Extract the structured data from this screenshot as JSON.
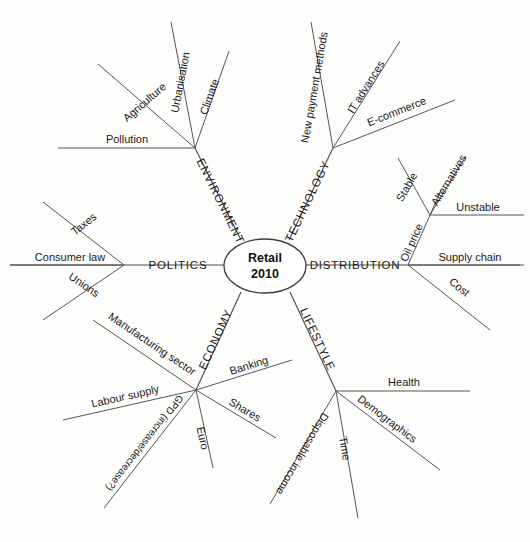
{
  "diagram": {
    "type": "radial-mind-map",
    "center": {
      "line1": "Retail",
      "line2": "2010"
    },
    "branches": [
      {
        "id": "environment",
        "label": "ENVIRONMENT",
        "twigs": [
          "Pollution",
          "Agriculture",
          "Urbanisation",
          "Climate"
        ]
      },
      {
        "id": "technology",
        "label": "TECHNOLOGY",
        "twigs": [
          "New payment methods",
          "IT advances",
          "E-commerce"
        ]
      },
      {
        "id": "distribution",
        "label": "DISTRIBUTION",
        "twigs": [
          "Oil price",
          "Supply chain",
          "Cost"
        ],
        "sub": {
          "parent": "Oil price",
          "twigs": [
            "Stable",
            "Alternatives",
            "Unstable"
          ]
        }
      },
      {
        "id": "lifestyle",
        "label": "LIFESTYLE",
        "twigs": [
          "Health",
          "Demographics",
          "Time",
          "Disposable income"
        ]
      },
      {
        "id": "economy",
        "label": "ECONOMY",
        "twigs": [
          "Manufacturing sector",
          "Banking",
          "Shares",
          "Euro",
          "GPD (increase/decrease?)",
          "Labour supply"
        ]
      },
      {
        "id": "politics",
        "label": "POLITICS",
        "twigs": [
          "Taxes",
          "Consumer law",
          "Unions"
        ]
      }
    ],
    "labels": {
      "center_line1": "Retail",
      "center_line2": "2010",
      "environment": "ENVIRONMENT",
      "technology": "TECHNOLOGY",
      "distribution": "DISTRIBUTION",
      "lifestyle": "LIFESTYLE",
      "economy": "ECONOMY",
      "politics": "POLITICS",
      "pollution": "Pollution",
      "agriculture": "Agriculture",
      "urbanisation": "Urbanisation",
      "climate": "Climate",
      "new_payment_methods": "New payment methods",
      "it_advances": "IT advances",
      "ecommerce": "E-commerce",
      "oil_price": "Oil price",
      "stable": "Stable",
      "alternatives": "Alternatives",
      "unstable": "Unstable",
      "supply_chain": "Supply chain",
      "cost": "Cost",
      "health": "Health",
      "demographics": "Demographics",
      "time": "Time",
      "disposable_income": "Disposable income",
      "manufacturing_sector": "Manufacturing sector",
      "banking": "Banking",
      "shares": "Shares",
      "euro": "Euro",
      "gpd": "GPD (increase/decrease?)",
      "labour_supply": "Labour supply",
      "taxes": "Taxes",
      "consumer_law": "Consumer law",
      "unions": "Unions"
    },
    "colors": {
      "background": "#fdfdfc",
      "line": "#4a4a4a",
      "text": "#1a1a1a"
    }
  }
}
